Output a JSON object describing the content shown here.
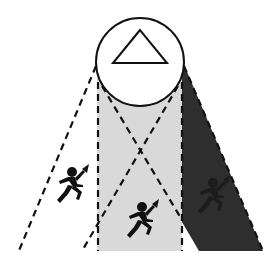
{
  "diagram": {
    "colors": {
      "background": "#ffffff",
      "light_zone": "#d9d9d9",
      "dark_zone": "#2e2e2e",
      "stroke": "#111111",
      "figure": "#111111",
      "hidden_figure": "#1e1e1e"
    },
    "source": {
      "shape": "circle",
      "icon": "triangle-icon",
      "cx": 140,
      "cy": 62,
      "r": 44
    },
    "zones": [
      {
        "name": "left-open-zone",
        "fill": "none"
      },
      {
        "name": "center-lit-zone",
        "fill": "light"
      },
      {
        "name": "right-shadow-zone",
        "fill": "dark"
      }
    ],
    "figures": [
      {
        "name": "runner-left",
        "x": 72,
        "y": 172,
        "visible": true
      },
      {
        "name": "runner-center",
        "x": 142,
        "y": 207,
        "visible": true
      },
      {
        "name": "runner-right",
        "x": 213,
        "y": 183,
        "visible": false
      }
    ]
  }
}
